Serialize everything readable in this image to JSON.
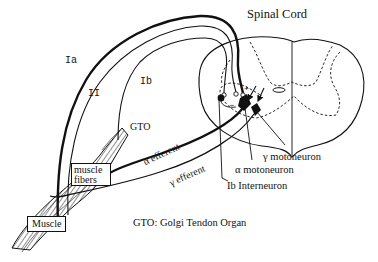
{
  "diagram": {
    "title": "Spinal Cord",
    "fibers": {
      "ia": "Ia",
      "ii": "II",
      "ib": "Ib"
    },
    "gto_label": "GTO",
    "efferents": {
      "alpha": "α efferent",
      "gamma": "γ efferent"
    },
    "neurons": {
      "gamma_motoneuron": "γ motoneuron",
      "alpha_motoneuron": "α motoneuron",
      "ib_interneuron": "Ib Interneuron"
    },
    "boxes": {
      "muscle_fibers_line1": "muscle",
      "muscle_fibers_line2": "fibers",
      "muscle": "Muscle"
    },
    "synapse_signs": {
      "plus": "+",
      "minus": "−"
    },
    "legend": "GTO: Golgi Tendon Organ",
    "colors": {
      "ink": "#111111",
      "background": "#ffffff"
    }
  }
}
